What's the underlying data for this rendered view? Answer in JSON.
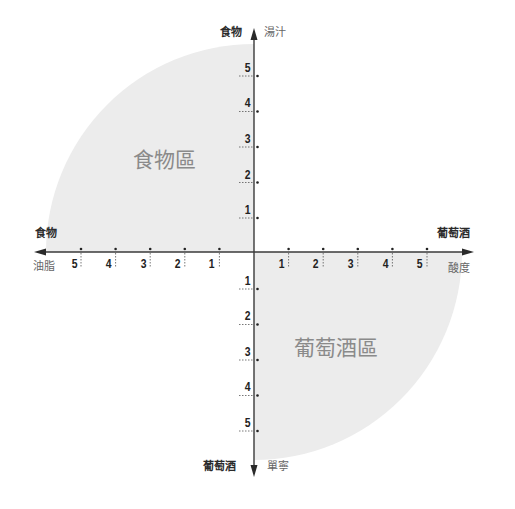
{
  "diagram": {
    "type": "quadrant-pairing-chart",
    "center": {
      "x": 254,
      "y": 252
    },
    "unit_px_x": 34.6,
    "unit_px_y": 35.7,
    "region_radius_px": 208,
    "colors": {
      "axis": "#3a3a3a",
      "region_fill": "#ececec",
      "region_text": "#8a8a8a",
      "strong_label": "#2a2a2a",
      "soft_label": "#666666"
    },
    "axes": {
      "top": {
        "category": "食物",
        "dimension": "湯汁"
      },
      "left": {
        "category": "食物",
        "dimension": "油脂"
      },
      "right": {
        "category": "葡萄酒",
        "dimension": "酸度"
      },
      "bottom": {
        "category": "葡萄酒",
        "dimension": "單寧"
      }
    },
    "ticks": {
      "top": [
        "1",
        "2",
        "3",
        "4",
        "5"
      ],
      "left": [
        "1",
        "2",
        "3",
        "4",
        "5"
      ],
      "right": [
        "1",
        "2",
        "3",
        "4",
        "5"
      ],
      "bottom": [
        "1",
        "2",
        "3",
        "4",
        "5"
      ]
    },
    "regions": {
      "food": {
        "label": "食物區",
        "quadrant": "top-left"
      },
      "wine": {
        "label": "葡萄酒區",
        "quadrant": "bottom-right"
      }
    }
  }
}
